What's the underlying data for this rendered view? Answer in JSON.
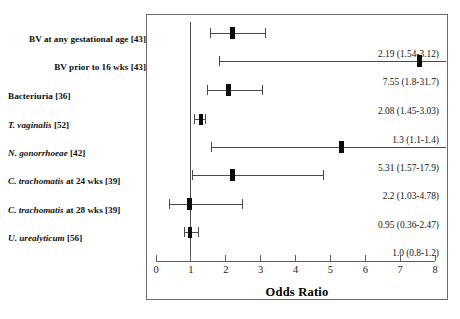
{
  "figure": {
    "axis_title": "Odds Ratio",
    "x_ticks": [
      "0",
      "1",
      "2",
      "3",
      "4",
      "5",
      "6",
      "7",
      "8"
    ],
    "x_min": 0,
    "x_max": 8,
    "null_value": 1,
    "frame_color": "#6b6b6b",
    "marker_color": "#0a0a0a",
    "line_color": "#4a4a4a"
  },
  "chart_data": {
    "type": "forest",
    "title": "",
    "xlabel": "Odds Ratio",
    "ylabel": "",
    "xlim": [
      0,
      8
    ],
    "xticks": [
      0,
      1,
      2,
      3,
      4,
      5,
      6,
      7,
      8
    ],
    "grid": false,
    "legend": "none",
    "reference_line": 1,
    "effect_measure": "Odds Ratio",
    "rows": [
      {
        "label_html": "BV at any gestational age [43]",
        "label_plain": "BV at any gestational age [43]",
        "label_align": "right",
        "label_style": "bold",
        "estimate": 2.19,
        "ci_low": 1.54,
        "ci_high": 3.12,
        "value_text": "2.19  (1.54-3.12)",
        "truncated_high": false
      },
      {
        "label_html": "BV prior to 16 wks [43]",
        "label_plain": "BV prior to 16 wks [43]",
        "label_align": "right",
        "label_style": "bold",
        "estimate": 7.55,
        "ci_low": 1.8,
        "ci_high": 31.7,
        "value_text": "7.55  (1.8-31.7)",
        "truncated_high": true
      },
      {
        "label_html": "Bacteriuria [36]",
        "label_plain": "Bacteriuria [36]",
        "label_align": "left",
        "label_style": "bold",
        "estimate": 2.08,
        "ci_low": 1.45,
        "ci_high": 3.03,
        "value_text": "2.08  (1.45-3.03)",
        "truncated_high": false
      },
      {
        "label_html": "<i>T. vaginalis</i> [52]",
        "label_plain": "T. vaginalis [52]",
        "label_align": "left",
        "label_style": "bold-italic",
        "estimate": 1.3,
        "ci_low": 1.1,
        "ci_high": 1.4,
        "value_text": "1.3  (1.1-1.4)",
        "truncated_high": false
      },
      {
        "label_html": "<i>N. gonorrhoeae</i> [42]",
        "label_plain": "N. gonorrhoeae [42]",
        "label_align": "left",
        "label_style": "bold-italic",
        "estimate": 5.31,
        "ci_low": 1.57,
        "ci_high": 17.9,
        "value_text": "5.31 (1.57-17.9)",
        "truncated_high": true
      },
      {
        "label_html": "<i>C. trachomatis</i> at 24 wks [39]",
        "label_plain": "C. trachomatis at 24 wks [39]",
        "label_align": "left",
        "label_style": "bold-italic",
        "estimate": 2.2,
        "ci_low": 1.03,
        "ci_high": 4.78,
        "value_text": "2.2  (1.03-4.78)",
        "truncated_high": false
      },
      {
        "label_html": "<i>C. trachomatis</i> at 28 wks [39]",
        "label_plain": "C. trachomatis at 28 wks [39]",
        "label_align": "left",
        "label_style": "bold-italic",
        "estimate": 0.95,
        "ci_low": 0.36,
        "ci_high": 2.47,
        "value_text": "0.95  (0.36-2.47)",
        "truncated_high": false
      },
      {
        "label_html": "<i>U. urealyticum</i> [56]",
        "label_plain": "U. urealyticum [56]",
        "label_align": "left",
        "label_style": "bold-italic",
        "estimate": 1.0,
        "ci_low": 0.8,
        "ci_high": 1.2,
        "value_text": "1.0  (0.8-1.2)",
        "truncated_high": false
      }
    ]
  }
}
